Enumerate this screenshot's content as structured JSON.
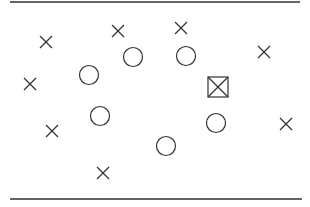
{
  "diagram": {
    "width": 310,
    "height": 207,
    "stroke_color": "#333333",
    "top_line": {
      "x1": 10,
      "x2": 300,
      "y": 2
    },
    "bottom_line": {
      "x1": 10,
      "x2": 302,
      "y": 199
    },
    "crosses": [
      {
        "x": 46,
        "y": 42
      },
      {
        "x": 118,
        "y": 31
      },
      {
        "x": 181,
        "y": 28
      },
      {
        "x": 264,
        "y": 52
      },
      {
        "x": 30,
        "y": 84
      },
      {
        "x": 52,
        "y": 131
      },
      {
        "x": 286,
        "y": 124
      },
      {
        "x": 103,
        "y": 173
      }
    ],
    "circles": [
      {
        "x": 89,
        "y": 75
      },
      {
        "x": 133,
        "y": 57
      },
      {
        "x": 186,
        "y": 56
      },
      {
        "x": 100,
        "y": 116
      },
      {
        "x": 216,
        "y": 123
      },
      {
        "x": 166,
        "y": 146
      }
    ],
    "boxed_cross": {
      "x": 218,
      "y": 87,
      "size": 20
    },
    "cross_half": 6,
    "circle_radius": 9.5
  }
}
